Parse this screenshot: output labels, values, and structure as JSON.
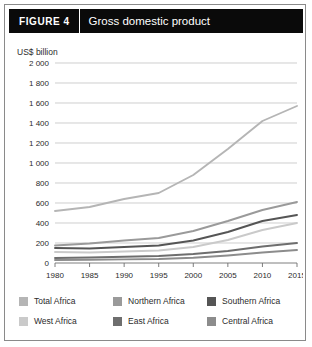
{
  "figure": {
    "tag_word": "FIGURE",
    "tag_number": "4",
    "title": "Gross domestic product"
  },
  "chart_data": {
    "type": "line",
    "title": "Gross domestic product",
    "xlabel": "",
    "ylabel": "US$ billion",
    "unit_label": "US$ billion",
    "grid": true,
    "legend_position": "bottom",
    "xlim": [
      1980,
      2015
    ],
    "ylim": [
      0,
      2000
    ],
    "ytick_labels": [
      "2 000",
      "1 800",
      "1 600",
      "1 400",
      "1 200",
      "1 000",
      "800",
      "600",
      "400",
      "200",
      "0"
    ],
    "ytick_values": [
      2000,
      1800,
      1600,
      1400,
      1200,
      1000,
      800,
      600,
      400,
      200,
      0
    ],
    "xtick_labels": [
      "1980",
      "1985",
      "1990",
      "1995",
      "2000",
      "2005",
      "2010",
      "2015"
    ],
    "xtick_values": [
      1980,
      1985,
      1990,
      1995,
      2000,
      2005,
      2010,
      2015
    ],
    "x": [
      1980,
      1985,
      1990,
      1995,
      2000,
      2005,
      2010,
      2015
    ],
    "series": [
      {
        "name": "Total Africa",
        "color": "#b5b5b5",
        "values": [
          520,
          560,
          640,
          700,
          880,
          1140,
          1420,
          1570
        ]
      },
      {
        "name": "Northern Africa",
        "color": "#9a9a9a",
        "values": [
          175,
          195,
          225,
          250,
          320,
          420,
          530,
          610
        ]
      },
      {
        "name": "Southern Africa",
        "color": "#555555",
        "values": [
          150,
          145,
          160,
          175,
          225,
          310,
          420,
          480
        ]
      },
      {
        "name": "West Africa",
        "color": "#cacaca",
        "values": [
          110,
          105,
          115,
          125,
          160,
          230,
          330,
          400
        ]
      },
      {
        "name": "East Africa",
        "color": "#6e6e6e",
        "values": [
          50,
          55,
          62,
          70,
          90,
          120,
          165,
          200
        ]
      },
      {
        "name": "Central Africa",
        "color": "#8c8c8c",
        "values": [
          30,
          32,
          36,
          40,
          52,
          75,
          105,
          130
        ]
      }
    ]
  },
  "legend": {
    "rows": [
      [
        {
          "label": "Total Africa",
          "color": "#b5b5b5"
        },
        {
          "label": "Northern Africa",
          "color": "#9a9a9a"
        },
        {
          "label": "Southern Africa",
          "color": "#555555"
        }
      ],
      [
        {
          "label": "West Africa",
          "color": "#cacaca"
        },
        {
          "label": "East Africa",
          "color": "#6e6e6e"
        },
        {
          "label": "Central Africa",
          "color": "#8c8c8c"
        }
      ]
    ]
  }
}
